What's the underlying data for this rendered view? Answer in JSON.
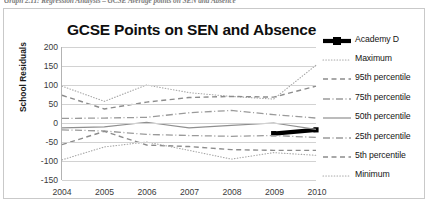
{
  "caption": "Graph 2.11: Regression Analysis – GCSE Average points on SEN and Absence",
  "chart_data": {
    "type": "line",
    "title": "GCSE Points on SEN and Absence",
    "xlabel": "",
    "ylabel": "School Residuals",
    "categories": [
      "2004",
      "2005",
      "2006",
      "2007",
      "2008",
      "2009",
      "2010"
    ],
    "ylim": [
      -150,
      200
    ],
    "yticks": [
      200,
      150,
      100,
      50,
      0,
      -50,
      -100,
      -150
    ],
    "grid": true,
    "legend_position": "right",
    "series": [
      {
        "name": "Academy D",
        "style": "thick-solid-marker",
        "color": "#000000",
        "values": [
          null,
          null,
          null,
          null,
          null,
          -28,
          -18
        ]
      },
      {
        "name": "Maximum",
        "style": "dotted",
        "color": "#a6a6a6",
        "values": [
          97,
          57,
          100,
          80,
          70,
          63,
          152
        ]
      },
      {
        "name": "95th percentile",
        "style": "dashed",
        "color": "#8c8c8c",
        "values": [
          73,
          37,
          55,
          67,
          70,
          68,
          97
        ]
      },
      {
        "name": "75th percentile",
        "style": "dash-dot",
        "color": "#9a9a9a",
        "values": [
          12,
          13,
          15,
          27,
          33,
          22,
          13
        ]
      },
      {
        "name": "50th percentile",
        "style": "solid",
        "color": "#8f8f8f",
        "values": [
          -13,
          -10,
          2,
          -13,
          -6,
          0,
          -17
        ]
      },
      {
        "name": "25th percentile",
        "style": "dash-dot",
        "color": "#9a9a9a",
        "values": [
          -18,
          -21,
          -30,
          -33,
          -35,
          -33,
          -38
        ]
      },
      {
        "name": "5th percentile",
        "style": "dashed",
        "color": "#8c8c8c",
        "values": [
          -57,
          -22,
          -58,
          -62,
          -70,
          -72,
          -72
        ]
      },
      {
        "name": "Minimum",
        "style": "dotted",
        "color": "#a6a6a6",
        "values": [
          -97,
          -63,
          -50,
          -72,
          -95,
          -78,
          -85
        ]
      }
    ]
  }
}
